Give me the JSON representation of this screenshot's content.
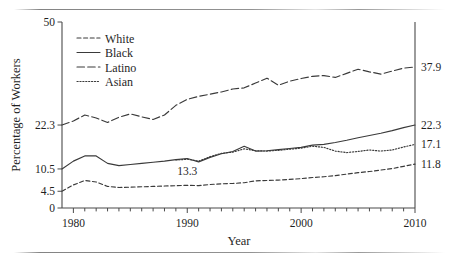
{
  "figure": {
    "yaxis_label": "Percentage of Workers",
    "xaxis_label": "Year",
    "y_ticks": [
      "0",
      "4.5",
      "10.5",
      "22.3",
      "50"
    ],
    "y_tick_values": [
      0,
      4.5,
      10.5,
      22.3,
      50
    ],
    "x_ticks": [
      "1980",
      "1990",
      "2000",
      "2010"
    ],
    "x_tick_values": [
      1980,
      1990,
      2000,
      2010
    ],
    "annotation": "13.3"
  },
  "legend": {
    "items": [
      {
        "label": "White",
        "style": "short-dash"
      },
      {
        "label": "Black",
        "style": "solid"
      },
      {
        "label": "Latino",
        "style": "long-dash"
      },
      {
        "label": "Asian",
        "style": "dotted"
      }
    ]
  },
  "end_labels": [
    {
      "label": "37.9",
      "series": "Latino"
    },
    {
      "label": "22.3",
      "series": "Black"
    },
    {
      "label": "17.1",
      "series": "Asian"
    },
    {
      "label": "11.8",
      "series": "White"
    }
  ],
  "chart_data": {
    "type": "line",
    "title": "",
    "xlabel": "Year",
    "ylabel": "Percentage of Workers",
    "xlim": [
      1979,
      2010
    ],
    "ylim": [
      0,
      50
    ],
    "grid": false,
    "legend_position": "top-left",
    "y_tick_values": [
      0,
      4.5,
      10.5,
      22.3,
      50
    ],
    "x_tick_values": [
      1980,
      1990,
      2000,
      2010
    ],
    "annotations": [
      {
        "text": "13.3",
        "x": 1990,
        "y": 11.6
      }
    ],
    "series": [
      {
        "name": "Latino",
        "dash": "long-dash",
        "end_value": 37.9,
        "x": [
          1979,
          1980,
          1981,
          1982,
          1983,
          1984,
          1985,
          1986,
          1987,
          1988,
          1989,
          1990,
          1991,
          1992,
          1993,
          1994,
          1995,
          1996,
          1997,
          1998,
          1999,
          2000,
          2001,
          2002,
          2003,
          2004,
          2005,
          2006,
          2007,
          2008,
          2009,
          2010
        ],
        "y": [
          22.3,
          23.4,
          25.0,
          24.2,
          23.0,
          24.4,
          25.3,
          24.5,
          23.8,
          25.0,
          27.6,
          29.2,
          30.0,
          30.6,
          31.2,
          32.0,
          32.3,
          33.6,
          34.9,
          33.0,
          34.1,
          34.8,
          35.4,
          35.6,
          35.1,
          36.2,
          37.3,
          36.6,
          36.0,
          36.8,
          37.6,
          37.9
        ]
      },
      {
        "name": "Black",
        "dash": "solid",
        "end_value": 22.3,
        "x": [
          1979,
          1980,
          1981,
          1982,
          1983,
          1984,
          1985,
          1986,
          1987,
          1988,
          1989,
          1990,
          1991,
          1992,
          1993,
          1994,
          1995,
          1996,
          1997,
          1998,
          1999,
          2000,
          2001,
          2002,
          2003,
          2004,
          2005,
          2006,
          2007,
          2008,
          2009,
          2010
        ],
        "y": [
          10.5,
          12.6,
          14.0,
          14.0,
          12.0,
          11.4,
          11.7,
          12.0,
          12.3,
          12.6,
          13.0,
          13.3,
          12.4,
          13.6,
          14.6,
          15.2,
          16.6,
          15.3,
          15.4,
          15.7,
          16.0,
          16.3,
          16.9,
          17.1,
          17.6,
          18.2,
          18.9,
          19.5,
          20.1,
          20.8,
          21.6,
          22.3
        ]
      },
      {
        "name": "Asian",
        "dash": "dotted",
        "end_value": 17.1,
        "x": [
          1989,
          1990,
          1991,
          1992,
          1993,
          1994,
          1995,
          1996,
          1997,
          1998,
          1999,
          2000,
          2001,
          2002,
          2003,
          2004,
          2005,
          2006,
          2007,
          2008,
          2009,
          2010
        ],
        "y": [
          12.9,
          13.1,
          12.6,
          13.8,
          14.7,
          15.0,
          15.9,
          15.4,
          15.3,
          15.5,
          15.8,
          16.1,
          16.6,
          16.3,
          15.3,
          14.9,
          15.2,
          15.6,
          15.3,
          15.6,
          16.4,
          17.1
        ]
      },
      {
        "name": "White",
        "dash": "short-dash",
        "end_value": 11.8,
        "x": [
          1979,
          1980,
          1981,
          1982,
          1983,
          1984,
          1985,
          1986,
          1987,
          1988,
          1989,
          1990,
          1991,
          1992,
          1993,
          1994,
          1995,
          1996,
          1997,
          1998,
          1999,
          2000,
          2001,
          2002,
          2003,
          2004,
          2005,
          2006,
          2007,
          2008,
          2009,
          2010
        ],
        "y": [
          4.5,
          6.2,
          7.4,
          7.0,
          5.8,
          5.5,
          5.6,
          5.7,
          5.8,
          5.9,
          6.0,
          6.1,
          6.0,
          6.3,
          6.5,
          6.6,
          6.8,
          7.3,
          7.4,
          7.5,
          7.7,
          7.9,
          8.2,
          8.4,
          8.7,
          9.1,
          9.5,
          9.8,
          10.2,
          10.6,
          11.2,
          11.8
        ]
      }
    ]
  }
}
